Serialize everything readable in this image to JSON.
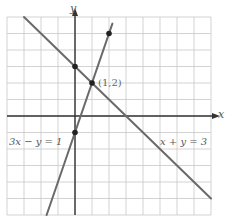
{
  "chart_data": {
    "type": "line",
    "title": "",
    "xlabel": "x",
    "ylabel": "y",
    "xlim": [
      -4,
      8
    ],
    "ylim": [
      -6,
      6
    ],
    "grid": true,
    "grid_step": 1,
    "series": [
      {
        "name": "x + y = 3",
        "equation": "x + y = 3",
        "x": [
          -3,
          8
        ],
        "y": [
          6,
          -5
        ],
        "marked_points": [
          [
            0,
            3
          ],
          [
            1,
            2
          ]
        ]
      },
      {
        "name": "3x - y = 1",
        "equation": "3x - y = 1",
        "x": [
          -1.67,
          2.2
        ],
        "y": [
          -6,
          5.6
        ],
        "marked_points": [
          [
            0,
            -1
          ],
          [
            1,
            2
          ],
          [
            2,
            5
          ]
        ]
      }
    ],
    "annotations": [
      {
        "text": "(1,2)",
        "x": 1,
        "y": 2,
        "note": "intersection point"
      },
      {
        "text": "3x − y = 1",
        "position": "lower-left"
      },
      {
        "text": "x + y = 3",
        "position": "lower-right"
      }
    ]
  },
  "labels": {
    "x_axis": "x",
    "y_axis": "y",
    "intersection": "(1,2)",
    "line1": "x + y = 3",
    "line2": "3x − y = 1"
  },
  "colors": {
    "grid": "#c8c8c8",
    "axis": "#333333",
    "line": "#6a6a6a",
    "point": "#222222",
    "text": "#555555"
  }
}
